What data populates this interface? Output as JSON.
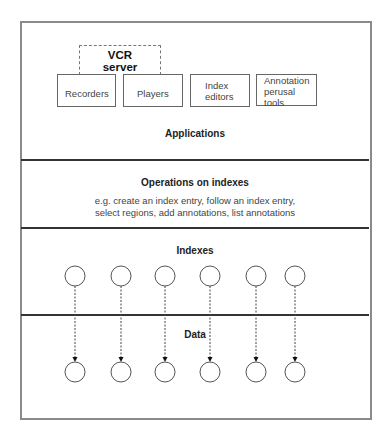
{
  "layers": {
    "applications": {
      "title": "Applications",
      "vcr_server": {
        "line1": "VCR",
        "line2": "server"
      },
      "boxes": [
        {
          "label": "Recorders"
        },
        {
          "label": "Players"
        },
        {
          "label": "Index editors",
          "lines": [
            "Index",
            "editors"
          ]
        },
        {
          "label": "Annotation perusal tools",
          "lines": [
            "Annotation",
            "perusal",
            "tools"
          ]
        }
      ]
    },
    "operations": {
      "title": "Operations on indexes",
      "line1": "e.g. create an index entry, follow an index entry,",
      "line2": "select regions, add annotations, list annotations"
    },
    "indexes": {
      "title": "Indexes",
      "node_count": 6
    },
    "data": {
      "title": "Data",
      "node_count": 6
    }
  },
  "colors": {
    "frame": "#8a8a8a",
    "divider": "#333333",
    "node_stroke": "#555555",
    "arrow": "#444444"
  }
}
